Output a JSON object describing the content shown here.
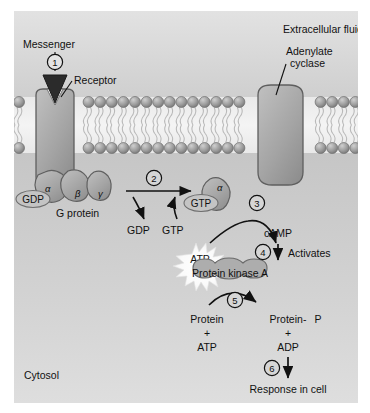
{
  "figure": {
    "compartments": {
      "extracellular_label": "Extracellular fluid",
      "cytosol_label": "Cytosol"
    },
    "colors": {
      "extracellular_bg": "#d8d8d8",
      "cytosol_bg": "#c9c9c9",
      "membrane_head": "#9a9a9a",
      "membrane_core": "#ededed",
      "protein_fill": "#a8a8a8",
      "protein_stroke": "#5a5a5a",
      "messenger_fill": "#2b2b2b",
      "text": "#111111",
      "starburst": "#f7f7f7",
      "page_bg": "#ffffff"
    },
    "labels": {
      "messenger": "Messenger",
      "receptor": "Receptor",
      "adenylate_cyclase_line1": "Adenylate",
      "adenylate_cyclase_line2": "cyclase",
      "g_protein": "G protein",
      "alpha": "α",
      "beta": "β",
      "gamma": "γ",
      "gdp_bound": "GDP",
      "gdp_released": "GDP",
      "gtp_incoming": "GTP",
      "gtp_bound": "GTP",
      "atp_substrate": "ATP",
      "camp": "cAMP",
      "activates": "Activates",
      "protein_kinase_a": "Protein kinase A",
      "protein": "Protein",
      "plus_left": "+",
      "atp_left": "ATP",
      "protein_p": "Protein-",
      "phosphate": "P",
      "plus_right": "+",
      "adp_right": "ADP",
      "response": "Response in cell"
    },
    "steps": [
      {
        "id": 1,
        "number": "1",
        "meaning": "messenger-binds-receptor"
      },
      {
        "id": 2,
        "number": "2",
        "meaning": "gdp-replaced-by-gtp"
      },
      {
        "id": 3,
        "number": "3",
        "meaning": "adenylate-cyclase-makes-camp"
      },
      {
        "id": 4,
        "number": "4",
        "meaning": "camp-activates-protein-kinase-a"
      },
      {
        "id": 5,
        "number": "5",
        "meaning": "kinase-phosphorylates-protein"
      },
      {
        "id": 6,
        "number": "6",
        "meaning": "response-in-cell"
      }
    ]
  }
}
